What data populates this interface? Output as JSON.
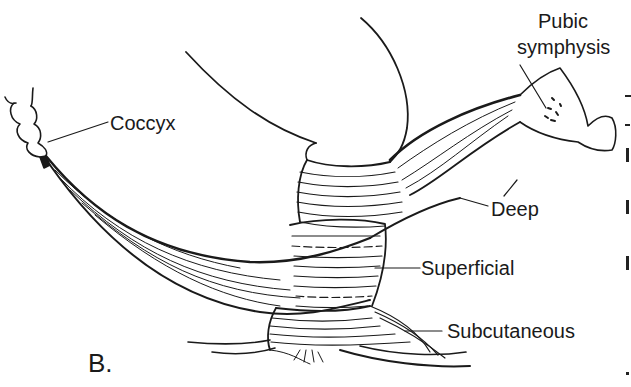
{
  "figure": {
    "panel_letter": "B.",
    "labels": {
      "pubic_symphysis_line1": "Pubic",
      "pubic_symphysis_line2": "symphysis",
      "coccyx": "Coccyx",
      "deep": "Deep",
      "superficial": "Superficial",
      "subcutaneous": "Subcutaneous"
    },
    "colors": {
      "ink": "#1a1a1a",
      "background": "#ffffff"
    }
  }
}
